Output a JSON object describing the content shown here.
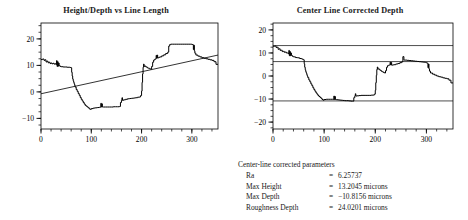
{
  "figure": {
    "background": "#ffffff",
    "ink_color": "#1a1a1a",
    "line_color": "#000000"
  },
  "left_chart_title": "Height/Depth vs Line Length",
  "right_chart_title": "Center Line Corrected Depth",
  "parameters": {
    "heading": "Center-line corrected parameters",
    "rows": [
      {
        "label": "Ra",
        "eq": "=",
        "value": "6.25737"
      },
      {
        "label": "Max Height",
        "eq": "=",
        "value": "13.2045 microns"
      },
      {
        "label": "Max Depth",
        "eq": "=",
        "value": "−10.8156 microns"
      },
      {
        "label": "Roughness Depth",
        "eq": "=",
        "value": "24.0201 microns"
      }
    ]
  },
  "chart_data": [
    {
      "type": "line",
      "id": "height-depth-vs-line-length",
      "title": "Height/Depth vs Line Length",
      "xlabel": "",
      "ylabel": "",
      "xlim": [
        0,
        352
      ],
      "ylim": [
        -14,
        26
      ],
      "xticks": [
        0,
        100,
        200,
        300
      ],
      "yticks": [
        -10,
        0,
        10,
        20
      ],
      "xtick_labels": [
        "0",
        "100",
        "200",
        "300"
      ],
      "ytick_labels": [
        "-10",
        "0",
        "10",
        "20"
      ],
      "minor_xtick_step": 20,
      "minor_ytick_step": 2.5,
      "grid": false,
      "legend": false,
      "series": [
        {
          "name": "profile",
          "kind": "step",
          "color": "#000000",
          "x": [
            0,
            3,
            6,
            8,
            10,
            12,
            14,
            16,
            18,
            20,
            22,
            24,
            26,
            28,
            30,
            31,
            32,
            33,
            34,
            35,
            36,
            38,
            40,
            44,
            48,
            52,
            56,
            58,
            60,
            61,
            62,
            63,
            64,
            65,
            66,
            67,
            68,
            70,
            72,
            74,
            76,
            78,
            80,
            82,
            84,
            86,
            88,
            90,
            92,
            94,
            96,
            98,
            100,
            104,
            108,
            112,
            116,
            118,
            119,
            120,
            121,
            122,
            124,
            128,
            132,
            136,
            140,
            144,
            148,
            152,
            156,
            158,
            160,
            161,
            162,
            164,
            168,
            172,
            176,
            180,
            184,
            188,
            192,
            196,
            198,
            200,
            201,
            202,
            203,
            204,
            205,
            206,
            208,
            210,
            212,
            214,
            216,
            218,
            220,
            222,
            224,
            226,
            228,
            229,
            230,
            231,
            232,
            234,
            236,
            240,
            244,
            248,
            252,
            254,
            256,
            258,
            262,
            266,
            270,
            274,
            278,
            282,
            286,
            290,
            294,
            298,
            300,
            302,
            303,
            304,
            305,
            306,
            308,
            312,
            316,
            320,
            324,
            328,
            332,
            336,
            340,
            344,
            348,
            352
          ],
          "y": [
            12.2,
            12.4,
            11.9,
            12.1,
            11.3,
            11.6,
            11.0,
            11.2,
            10.7,
            10.9,
            10.6,
            10.8,
            10.5,
            10.6,
            10.3,
            11.8,
            9.6,
            11.4,
            9.7,
            10.9,
            9.9,
            9.6,
            9.5,
            9.4,
            9.4,
            9.3,
            9.3,
            9.2,
            9.1,
            7.4,
            6.0,
            4.9,
            4.2,
            3.6,
            3.0,
            2.4,
            1.8,
            0.9,
            0.2,
            -0.6,
            -1.3,
            -2.1,
            -2.8,
            -3.4,
            -4.0,
            -4.6,
            -5.1,
            -5.4,
            -5.7,
            -6.0,
            -6.4,
            -6.6,
            -6.3,
            -6.1,
            -6.0,
            -5.9,
            -5.8,
            -5.8,
            -4.3,
            -5.7,
            -4.5,
            -5.7,
            -5.7,
            -5.7,
            -5.7,
            -5.7,
            -5.7,
            -5.6,
            -5.6,
            -5.6,
            -5.5,
            -4.0,
            -3.2,
            -2.2,
            -3.2,
            -3.0,
            -2.8,
            -2.6,
            -2.5,
            -2.4,
            -2.3,
            -2.2,
            -2.0,
            -1.9,
            -1.4,
            0.3,
            3.6,
            6.8,
            9.3,
            10.5,
            9.6,
            9.8,
            9.5,
            9.3,
            9.0,
            8.9,
            8.7,
            8.6,
            9.6,
            11.2,
            12.0,
            12.3,
            12.5,
            13.8,
            12.7,
            13.9,
            12.8,
            13.0,
            13.2,
            13.6,
            14.0,
            14.5,
            15.0,
            17.3,
            17.9,
            18.0,
            18.0,
            18.0,
            18.0,
            18.0,
            18.0,
            18.0,
            18.0,
            18.0,
            18.0,
            18.0,
            17.9,
            17.8,
            16.0,
            17.6,
            15.5,
            14.6,
            13.9,
            13.5,
            13.2,
            12.9,
            12.7,
            12.5,
            12.3,
            12.1,
            11.9,
            11.4,
            10.4
          ]
        },
        {
          "name": "least-squares center line",
          "kind": "straight",
          "color": "#000000",
          "x": [
            0,
            352
          ],
          "y": [
            -0.7,
            13.9
          ]
        }
      ]
    },
    {
      "type": "line",
      "id": "center-line-corrected-depth",
      "title": "Center Line Corrected Depth",
      "xlabel": "",
      "ylabel": "",
      "xlim": [
        0,
        352
      ],
      "ylim": [
        -23,
        23
      ],
      "xticks": [
        0,
        100,
        200,
        300
      ],
      "yticks": [
        -20,
        -10,
        0,
        10,
        20
      ],
      "xtick_labels": [
        "0",
        "100",
        "200",
        "300"
      ],
      "ytick_labels": [
        "-20",
        "-10",
        "0",
        "10",
        "20"
      ],
      "minor_xtick_step": 20,
      "minor_ytick_step": 2.5,
      "grid": false,
      "legend": false,
      "reference_lines": [
        {
          "name": "max-height-line",
          "y": 13.2045
        },
        {
          "name": "ra-line",
          "y": 6.25737
        },
        {
          "name": "max-depth-line",
          "y": -10.8156
        }
      ],
      "series": [
        {
          "name": "corrected profile",
          "kind": "step",
          "color": "#000000",
          "x": [
            0,
            3,
            6,
            8,
            10,
            12,
            14,
            16,
            18,
            20,
            22,
            24,
            26,
            28,
            30,
            31,
            32,
            33,
            34,
            35,
            36,
            38,
            40,
            44,
            48,
            52,
            56,
            58,
            60,
            61,
            62,
            63,
            64,
            65,
            66,
            67,
            68,
            70,
            72,
            74,
            76,
            78,
            80,
            82,
            84,
            86,
            88,
            90,
            92,
            94,
            96,
            98,
            100,
            104,
            108,
            112,
            116,
            118,
            119,
            120,
            121,
            122,
            124,
            128,
            132,
            136,
            140,
            144,
            148,
            152,
            156,
            158,
            160,
            161,
            162,
            164,
            168,
            172,
            176,
            180,
            184,
            188,
            192,
            196,
            198,
            200,
            201,
            202,
            203,
            204,
            205,
            206,
            208,
            210,
            212,
            214,
            216,
            218,
            220,
            222,
            224,
            226,
            228,
            229,
            230,
            231,
            232,
            234,
            236,
            240,
            244,
            248,
            252,
            254,
            256,
            258,
            262,
            266,
            270,
            274,
            278,
            282,
            286,
            290,
            294,
            298,
            300,
            302,
            303,
            304,
            305,
            306,
            308,
            312,
            316,
            320,
            324,
            328,
            332,
            336,
            340,
            344,
            348,
            352
          ],
          "y": [
            12.9,
            13.0,
            12.4,
            12.5,
            11.6,
            11.8,
            11.1,
            11.2,
            10.6,
            10.7,
            10.3,
            10.4,
            10.0,
            10.0,
            9.6,
            11.1,
            8.8,
            10.6,
            8.8,
            10.0,
            8.9,
            8.5,
            8.3,
            8.0,
            7.9,
            7.6,
            7.4,
            7.2,
            7.0,
            5.3,
            3.8,
            2.7,
            1.9,
            1.3,
            0.6,
            0.0,
            -0.7,
            -1.7,
            -2.5,
            -3.4,
            -4.2,
            -5.1,
            -5.9,
            -6.6,
            -7.3,
            -7.9,
            -8.5,
            -8.9,
            -9.3,
            -9.7,
            -10.2,
            -10.5,
            -10.2,
            -10.1,
            -10.1,
            -10.1,
            -10.1,
            -10.2,
            -8.7,
            -10.2,
            -8.9,
            -10.2,
            -10.3,
            -10.4,
            -10.5,
            -10.6,
            -10.7,
            -10.7,
            -10.8,
            -10.9,
            -10.9,
            -9.4,
            -8.6,
            -7.7,
            -8.7,
            -8.6,
            -8.5,
            -8.4,
            -8.4,
            -8.4,
            -8.4,
            -8.4,
            -8.3,
            -8.3,
            -7.9,
            -6.2,
            -2.9,
            0.3,
            2.8,
            3.9,
            3.0,
            3.1,
            2.7,
            2.4,
            2.0,
            1.8,
            1.5,
            1.3,
            2.3,
            3.8,
            4.5,
            4.7,
            4.8,
            6.0,
            4.8,
            5.9,
            4.7,
            4.8,
            4.9,
            5.2,
            5.4,
            5.8,
            6.2,
            8.4,
            6.9,
            6.9,
            6.8,
            6.7,
            6.6,
            6.5,
            6.4,
            6.3,
            6.2,
            6.1,
            6.0,
            5.9,
            5.7,
            5.5,
            3.6,
            5.2,
            3.1,
            2.1,
            1.3,
            0.8,
            0.4,
            0.0,
            -0.3,
            -0.5,
            -0.8,
            -1.0,
            -1.2,
            -1.8,
            -3.0
          ]
        }
      ]
    }
  ]
}
